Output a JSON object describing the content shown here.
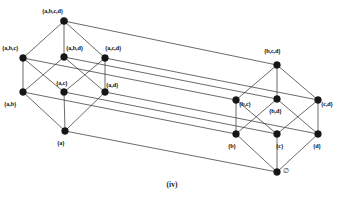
{
  "figure": {
    "caption": "(iv)",
    "colors": {
      "background": "#ffffff",
      "edge": "#3a3a3a",
      "vertex": "#161616",
      "label": "#121212"
    }
  },
  "chart_data": {
    "type": "diagram",
    "subtype": "hasse-diagram",
    "title": "(iv)",
    "nodes": [
      {
        "id": "abcd",
        "label": "{a,b,c,d}",
        "rank": 4,
        "x": 64,
        "y": 21,
        "label_x": 42,
        "label_y": 8,
        "dot_r": 3.6
      },
      {
        "id": "abc",
        "label": "{a,b,c}",
        "rank": 3,
        "x": 23,
        "y": 58,
        "label_x": 2,
        "label_y": 45,
        "dot_r": 3.4
      },
      {
        "id": "abd",
        "label": "{a,b,d}",
        "rank": 3,
        "x": 64,
        "y": 57,
        "label_x": 66,
        "label_y": 45,
        "dot_r": 3.4
      },
      {
        "id": "acd",
        "label": "{a,c,d}",
        "rank": 3,
        "x": 105,
        "y": 58,
        "label_x": 105,
        "label_y": 45,
        "dot_r": 3.4
      },
      {
        "id": "bcd",
        "label": "{b,c,d}",
        "rank": 3,
        "x": 277,
        "y": 65,
        "label_x": 264,
        "label_y": 48,
        "dot_r": 3.4
      },
      {
        "id": "ab",
        "label": "{a,b}",
        "rank": 2,
        "x": 23,
        "y": 92,
        "label_x": 4,
        "label_y": 101,
        "dot_r": 3.4
      },
      {
        "id": "ac",
        "label": "{a,c}",
        "rank": 2,
        "x": 64,
        "y": 92,
        "label_x": 56,
        "label_y": 80,
        "dot_r": 3.4
      },
      {
        "id": "ad",
        "label": "{a,d}",
        "rank": 2,
        "x": 105,
        "y": 92,
        "label_x": 106,
        "label_y": 82,
        "dot_r": 3.4
      },
      {
        "id": "bc",
        "label": "{b,c}",
        "rank": 2,
        "x": 236,
        "y": 100,
        "label_x": 239,
        "label_y": 101,
        "dot_r": 3.4
      },
      {
        "id": "bd",
        "label": "{b,d}",
        "rank": 2,
        "x": 277,
        "y": 99,
        "label_x": 269,
        "label_y": 108,
        "dot_r": 3.4
      },
      {
        "id": "cd",
        "label": "{c,d}",
        "rank": 2,
        "x": 318,
        "y": 100,
        "label_x": 321,
        "label_y": 101,
        "dot_r": 3.4
      },
      {
        "id": "a",
        "label": "{a}",
        "rank": 1,
        "x": 65,
        "y": 131,
        "label_x": 57,
        "label_y": 140,
        "dot_r": 3.4
      },
      {
        "id": "b",
        "label": "{b}",
        "rank": 1,
        "x": 236,
        "y": 134,
        "label_x": 228,
        "label_y": 143,
        "dot_r": 3.4
      },
      {
        "id": "c",
        "label": "{c}",
        "rank": 1,
        "x": 277,
        "y": 134,
        "label_x": 276,
        "label_y": 143,
        "dot_r": 3.4
      },
      {
        "id": "d",
        "label": "{d}",
        "rank": 1,
        "x": 318,
        "y": 134,
        "label_x": 313,
        "label_y": 143,
        "dot_r": 3.4
      },
      {
        "id": "empty",
        "label": "∅",
        "rank": 0,
        "x": 277,
        "y": 172,
        "label_x": 283,
        "label_y": 168,
        "dot_r": 3.4
      }
    ],
    "edges": [
      {
        "from": "abcd",
        "to": "abc"
      },
      {
        "from": "abcd",
        "to": "abd"
      },
      {
        "from": "abcd",
        "to": "acd"
      },
      {
        "from": "abcd",
        "to": "bcd"
      },
      {
        "from": "abc",
        "to": "ab"
      },
      {
        "from": "abc",
        "to": "ac"
      },
      {
        "from": "abc",
        "to": "bc"
      },
      {
        "from": "abd",
        "to": "ab"
      },
      {
        "from": "abd",
        "to": "ad"
      },
      {
        "from": "abd",
        "to": "bd"
      },
      {
        "from": "acd",
        "to": "ac"
      },
      {
        "from": "acd",
        "to": "ad"
      },
      {
        "from": "acd",
        "to": "cd"
      },
      {
        "from": "bcd",
        "to": "bc"
      },
      {
        "from": "bcd",
        "to": "bd"
      },
      {
        "from": "bcd",
        "to": "cd"
      },
      {
        "from": "ab",
        "to": "a"
      },
      {
        "from": "ab",
        "to": "b"
      },
      {
        "from": "ac",
        "to": "a"
      },
      {
        "from": "ac",
        "to": "c"
      },
      {
        "from": "ad",
        "to": "a"
      },
      {
        "from": "ad",
        "to": "d"
      },
      {
        "from": "bc",
        "to": "b"
      },
      {
        "from": "bc",
        "to": "c"
      },
      {
        "from": "bd",
        "to": "b"
      },
      {
        "from": "bd",
        "to": "d"
      },
      {
        "from": "cd",
        "to": "c"
      },
      {
        "from": "cd",
        "to": "d"
      },
      {
        "from": "a",
        "to": "empty"
      },
      {
        "from": "b",
        "to": "empty"
      },
      {
        "from": "c",
        "to": "empty"
      },
      {
        "from": "d",
        "to": "empty"
      }
    ]
  }
}
